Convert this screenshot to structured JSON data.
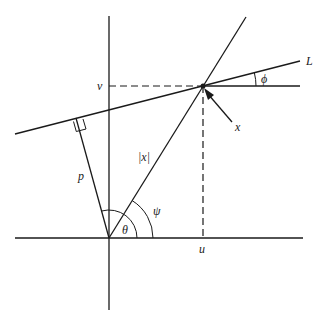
{
  "diagram": {
    "type": "geometry",
    "labels": {
      "line": "L",
      "point": "x",
      "magnitude": "|x|",
      "perpendicular_distance": "p",
      "u_coord": "u",
      "v_coord": "v",
      "angle_theta": "θ",
      "angle_psi": "ψ",
      "angle_phi": "ϕ"
    }
  }
}
